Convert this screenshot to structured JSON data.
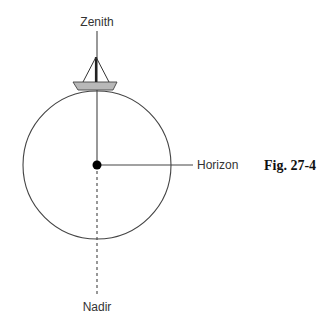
{
  "diagram": {
    "labels": {
      "zenith": "Zenith",
      "horizon": "Horizon",
      "nadir": "Nadir"
    },
    "figure_caption": "Fig. 27-4",
    "elements": [
      "circle (Earth)",
      "center point",
      "boat on top of circle",
      "zenith line (solid, up)",
      "horizon line (solid, right)",
      "nadir line (dashed, down)"
    ],
    "colors": {
      "stroke": "#444444",
      "hull_fill": "#b8b8b8",
      "dot": "#000000"
    }
  }
}
